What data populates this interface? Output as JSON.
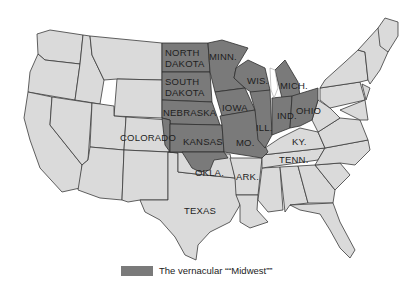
{
  "map": {
    "title": "",
    "highlight_color": "#7a7a7a",
    "base_color": "#dadada",
    "border_color": "#3a3a3a",
    "labels": {
      "north_dakota": "NORTH\nDAKOTA",
      "south_dakota": "SOUTH\nDAKOTA",
      "minnesota": "MINN.",
      "wisconsin": "WIS.",
      "michigan": "MICH.",
      "nebraska": "NEBRASKA",
      "iowa": "IOWA",
      "illinois": "ILL.",
      "indiana": "IND.",
      "ohio": "OHIO",
      "colorado": "COLORADO",
      "kansas": "KANSAS",
      "missouri": "MO.",
      "kentucky": "KY.",
      "tennessee": "TENN.",
      "oklahoma": "OKLA.",
      "arkansas": "ARK.",
      "texas": "TEXAS"
    },
    "highlighted_states": [
      "North Dakota",
      "South Dakota",
      "Minnesota",
      "Wisconsin",
      "Michigan",
      "Nebraska",
      "Iowa",
      "Illinois",
      "Indiana",
      "Ohio",
      "Kansas",
      "Missouri",
      "Oklahoma (partial)",
      "Colorado (eastern edge)"
    ]
  },
  "legend": {
    "label": "The vernacular ““Midwest””",
    "swatch_color": "#7a7a7a"
  }
}
